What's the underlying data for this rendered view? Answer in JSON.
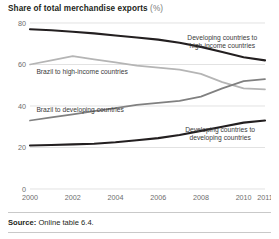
{
  "chart_title": {
    "main": "Share of total merchandise exports",
    "unit": "(%)"
  },
  "footer": {
    "source_label": "Source:",
    "source_text": "Online table 6.4."
  },
  "colors": {
    "dark_line": "#231f20",
    "mid_gray_line": "#808080",
    "light_gray_line": "#b5b5b5",
    "gridline": "#d6d6d6",
    "axis_text": "#6d6d6d",
    "annotation_text": "#3a3a3a",
    "background": "#ffffff"
  },
  "chart_data": {
    "type": "line",
    "title": "Share of total merchandise exports (%)",
    "xlabel": "",
    "ylabel": "",
    "ylim": [
      0,
      80
    ],
    "yticks": [
      0,
      20,
      40,
      60,
      80
    ],
    "xticks": [
      2000,
      2002,
      2004,
      2006,
      2008,
      2010,
      2011
    ],
    "xtick_labels": [
      "2000",
      "2002",
      "2004",
      "2006",
      "2008",
      "2010",
      "2011"
    ],
    "x": [
      2000,
      2001,
      2002,
      2003,
      2004,
      2005,
      2006,
      2007,
      2008,
      2009,
      2010,
      2011
    ],
    "grid": "horizontal",
    "legend_position": "inline-annotations",
    "series": [
      {
        "name": "Developing countries to high-income countries",
        "color": "#231f20",
        "annotation": [
          "Developing countries to",
          "high-income countries"
        ],
        "values": [
          77.0,
          76.5,
          75.8,
          75.0,
          74.0,
          73.0,
          72.0,
          70.5,
          68.5,
          66.0,
          63.5,
          62.0
        ]
      },
      {
        "name": "Brazil to high-income countries",
        "color": "#b5b5b5",
        "annotation": [
          "Brazil to high-income countries"
        ],
        "values": [
          60.0,
          62.0,
          64.0,
          62.5,
          61.0,
          59.5,
          58.5,
          57.5,
          55.5,
          51.5,
          48.5,
          48.0
        ]
      },
      {
        "name": "Brazil to developing countries",
        "color": "#808080",
        "annotation": [
          "Brazil to developing countries"
        ],
        "values": [
          33.0,
          34.5,
          36.0,
          37.5,
          39.0,
          40.5,
          41.5,
          42.5,
          44.5,
          48.5,
          52.0,
          53.0
        ]
      },
      {
        "name": "Developing countries to developing countries",
        "color": "#231f20",
        "annotation": [
          "Developing countries to",
          "developing countries"
        ],
        "values": [
          21.0,
          21.2,
          21.5,
          21.8,
          22.5,
          23.5,
          24.5,
          26.0,
          28.0,
          30.0,
          32.0,
          33.0
        ]
      }
    ]
  }
}
